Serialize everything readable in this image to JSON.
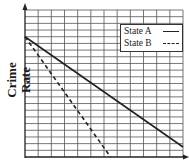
{
  "chart_data": {
    "type": "line",
    "title": "",
    "xlabel": "",
    "ylabel": "Crime Rate",
    "grid": true,
    "grid_columns": 12,
    "grid_rows": 22,
    "xlim": [
      0,
      12
    ],
    "ylim": [
      0,
      22
    ],
    "legend_position": "upper right",
    "series": [
      {
        "name": "State A",
        "style": "solid",
        "x": [
          0,
          12
        ],
        "y": [
          18,
          1.5
        ]
      },
      {
        "name": "State B",
        "style": "dashed",
        "x": [
          0,
          6.5
        ],
        "y": [
          18,
          0
        ]
      }
    ]
  },
  "legend": {
    "items": [
      {
        "label": "State A",
        "style": "solid"
      },
      {
        "label": "State B",
        "style": "dashed"
      }
    ]
  },
  "axis": {
    "ylabel": "Crime Rate"
  },
  "colors": {
    "line": "#222222",
    "grid": "#555555",
    "background": "#ffffff"
  }
}
